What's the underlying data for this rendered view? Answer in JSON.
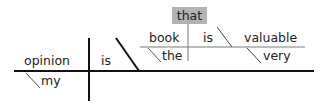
{
  "diagram": {
    "type": "sentence-diagram",
    "sentence_words": {
      "subject": "opinion",
      "subject_modifier": "my",
      "verb": "is",
      "relative_pronoun": "that",
      "clause_subject": "book",
      "clause_subject_modifier": "the",
      "clause_verb": "is",
      "clause_complement": "valuable",
      "clause_complement_modifier": "very"
    },
    "colors": {
      "main_line": "#111111",
      "clause_line": "#a6a6a6",
      "highlight_box": "#b3b3b3",
      "text": "#222222"
    }
  }
}
